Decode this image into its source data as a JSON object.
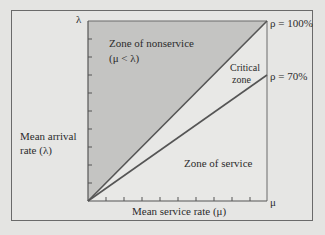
{
  "diagram": {
    "y_axis": {
      "symbol": "λ",
      "label_line1": "Mean arrival",
      "label_line2": "rate (λ)"
    },
    "x_axis": {
      "symbol": "μ",
      "label": "Mean service rate (μ)"
    },
    "regions": {
      "nonservice": {
        "line1": "Zone of nonservice",
        "line2": "(μ < λ)"
      },
      "critical": {
        "line1": "Critical",
        "line2": "zone"
      },
      "service": {
        "label": "Zone of service"
      }
    },
    "lines": [
      {
        "name": "rho-100",
        "label": "ρ = 100%",
        "utilization": 1.0
      },
      {
        "name": "rho-70",
        "label": "ρ = 70%",
        "utilization": 0.7
      }
    ],
    "colors": {
      "nonservice_fill": "#c4c4c2",
      "service_fill": "#e6e6e4",
      "line": "#555555",
      "frame": "#6a6a6a"
    },
    "y_ticks": 9,
    "x_ticks": 9
  }
}
